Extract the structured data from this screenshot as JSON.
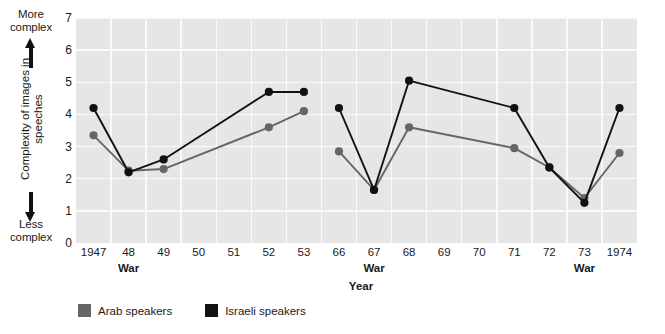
{
  "chart_data": {
    "type": "line",
    "title": "",
    "xlabel": "Year",
    "ylabel": "Complexity of images in speeches",
    "ylim": [
      0,
      7
    ],
    "ytick_labels": [
      "0",
      "1",
      "2",
      "3",
      "4",
      "5",
      "6",
      "7"
    ],
    "grid": true,
    "legend_position": "bottom-left",
    "axis_top_note": "More complex",
    "axis_bottom_note": "Less complex",
    "ylabel_line1": "Complexity of images",
    "ylabel_line2": "in speeches",
    "x": [
      "1947",
      "48",
      "49",
      "50",
      "51",
      "52",
      "53",
      "66",
      "67",
      "68",
      "69",
      "70",
      "71",
      "72",
      "73",
      "1974"
    ],
    "xtick_labels": [
      "1947",
      "48",
      "49",
      "50",
      "51",
      "52",
      "53",
      "66",
      "67",
      "68",
      "69",
      "70",
      "71",
      "72",
      "73",
      "1974"
    ],
    "war_markers": [
      "48",
      "67",
      "73"
    ],
    "war_label": "War",
    "axis_break_after": "53",
    "series": [
      {
        "name": "Arab speakers",
        "color": "#666666",
        "points": [
          {
            "x": "1947",
            "y": 3.35
          },
          {
            "x": "48",
            "y": 2.25
          },
          {
            "x": "49",
            "y": 2.3
          },
          {
            "x": "52",
            "y": 3.6
          },
          {
            "x": "53",
            "y": 4.1
          },
          {
            "x": "66",
            "y": 2.85
          },
          {
            "x": "67",
            "y": 1.65
          },
          {
            "x": "68",
            "y": 3.6
          },
          {
            "x": "71",
            "y": 2.95
          },
          {
            "x": "72",
            "y": 2.35
          },
          {
            "x": "73",
            "y": 1.4
          },
          {
            "x": "1974",
            "y": 2.8
          }
        ]
      },
      {
        "name": "Israeli speakers",
        "color": "#111111",
        "points": [
          {
            "x": "1947",
            "y": 4.2
          },
          {
            "x": "48",
            "y": 2.2
          },
          {
            "x": "49",
            "y": 2.6
          },
          {
            "x": "52",
            "y": 4.7
          },
          {
            "x": "53",
            "y": 4.7
          },
          {
            "x": "66",
            "y": 4.2
          },
          {
            "x": "67",
            "y": 1.65
          },
          {
            "x": "68",
            "y": 5.05
          },
          {
            "x": "71",
            "y": 4.2
          },
          {
            "x": "72",
            "y": 2.35
          },
          {
            "x": "73",
            "y": 1.25
          },
          {
            "x": "1974",
            "y": 4.2
          }
        ]
      }
    ],
    "legend": [
      {
        "label": "Arab speakers",
        "color": "#666666"
      },
      {
        "label": "Israeli speakers",
        "color": "#111111"
      }
    ],
    "plot_background": "#e6e6e6",
    "gridline_color": "#fafafa"
  }
}
